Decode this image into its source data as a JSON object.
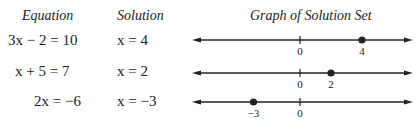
{
  "headers": {
    "equation": "Equation",
    "solution": "Solution",
    "graph": "Graph of Solution Set"
  },
  "rows": [
    {
      "equation": "3x − 2 = 10",
      "solution": "x = 4",
      "point": 4,
      "labels": [
        "0",
        "4"
      ]
    },
    {
      "equation": "x + 5 = 7",
      "solution": "x = 2",
      "point": 2,
      "labels": [
        "0",
        "2"
      ]
    },
    {
      "equation": "2x = −6",
      "solution": "x = −3",
      "point": -3,
      "labels": [
        "−3",
        "0"
      ]
    }
  ],
  "number_line": {
    "zero_x": 300,
    "unit_px": 15.5,
    "x_start": 192,
    "x_end": 413,
    "row_y": [
      40,
      73,
      102
    ]
  },
  "colors": {
    "ink": "#222222",
    "background": "#ffffff"
  }
}
